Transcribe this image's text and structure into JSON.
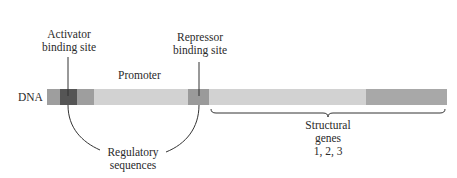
{
  "diagram": {
    "dna_label": "DNA",
    "labels": {
      "activator": [
        "Activator",
        "binding site"
      ],
      "repressor": [
        "Repressor",
        "binding site"
      ],
      "promoter": "Promoter",
      "regulatory": [
        "Regulatory",
        "sequences"
      ],
      "structural": [
        "Structural",
        "genes",
        "1, 2, 3"
      ]
    },
    "segments": [
      {
        "name": "flank-left",
        "x0": 47,
        "x1": 60,
        "color": "#9e9e9e"
      },
      {
        "name": "activator-binding-site",
        "x0": 60,
        "x1": 77,
        "color": "#555555"
      },
      {
        "name": "flank-mid",
        "x0": 77,
        "x1": 94,
        "color": "#9e9e9e"
      },
      {
        "name": "promoter",
        "x0": 94,
        "x1": 188,
        "color": "#d2d2d2"
      },
      {
        "name": "repressor-binding-site",
        "x0": 188,
        "x1": 209,
        "color": "#9a9a9a"
      },
      {
        "name": "structural-genes-light",
        "x0": 209,
        "x1": 366,
        "color": "#d2d2d2"
      },
      {
        "name": "structural-genes-dark",
        "x0": 366,
        "x1": 447,
        "color": "#a8a8a8"
      }
    ]
  }
}
